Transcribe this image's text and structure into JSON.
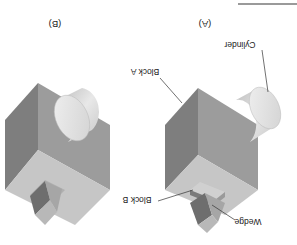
{
  "figure": {
    "orientation": "rotated 180 degrees",
    "panels": [
      {
        "id": "A",
        "caption": "(A)",
        "labels": {
          "block_a": "Block A",
          "cylinder": "Cylinder",
          "block_b": "Block B",
          "wedge": "Wedge"
        }
      },
      {
        "id": "B",
        "caption": "(B)"
      }
    ]
  },
  "colors": {
    "block_dark": "#7a7a7a",
    "block_mid": "#9a9a9a",
    "block_light": "#c4c4c4",
    "cylinder_side": "#d6d6d6",
    "cylinder_face": "#e6e6e6",
    "leader_line": "#333333"
  }
}
